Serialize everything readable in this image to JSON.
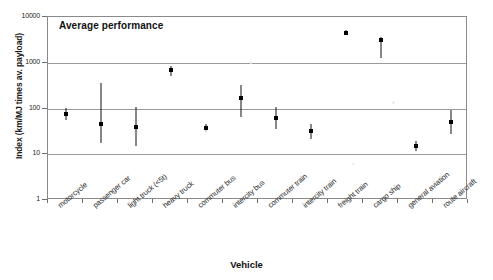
{
  "chart_data": {
    "type": "scatter",
    "title": "Average performance",
    "xlabel": "Vehicle",
    "ylabel": "Index (km/MJ times av. payload)",
    "yscale": "log",
    "ylim": [
      1,
      10000
    ],
    "ytick_labels": [
      "10000",
      "1000",
      "100",
      "10",
      "1"
    ],
    "ytick_values": [
      10000,
      1000,
      100,
      10,
      1
    ],
    "grid": true,
    "legend": "none",
    "categories": [
      "motorcycle",
      "passenger car",
      "light truck (<5t)",
      "heavy truck",
      "commuter bus",
      "intercity bus",
      "commuter train",
      "intercity train",
      "freight train",
      "cargo ship",
      "general aviation",
      "route aircraft"
    ],
    "series": [
      {
        "name": "Average performance index",
        "values": [
          75,
          45,
          40,
          680,
          38,
          170,
          62,
          32,
          4500,
          3200,
          15,
          50
        ],
        "err_low": [
          55,
          18,
          15,
          520,
          30,
          65,
          36,
          22,
          4200,
          1300,
          12,
          28
        ],
        "err_high": [
          105,
          360,
          110,
          830,
          46,
          320,
          110,
          45,
          5200,
          3600,
          19,
          95
        ]
      }
    ]
  },
  "figure": {
    "background_color": "#ffffff",
    "axis_color": "#8a8a8a",
    "grid_color": "#9a9a9a",
    "marker_color": "#000000"
  }
}
